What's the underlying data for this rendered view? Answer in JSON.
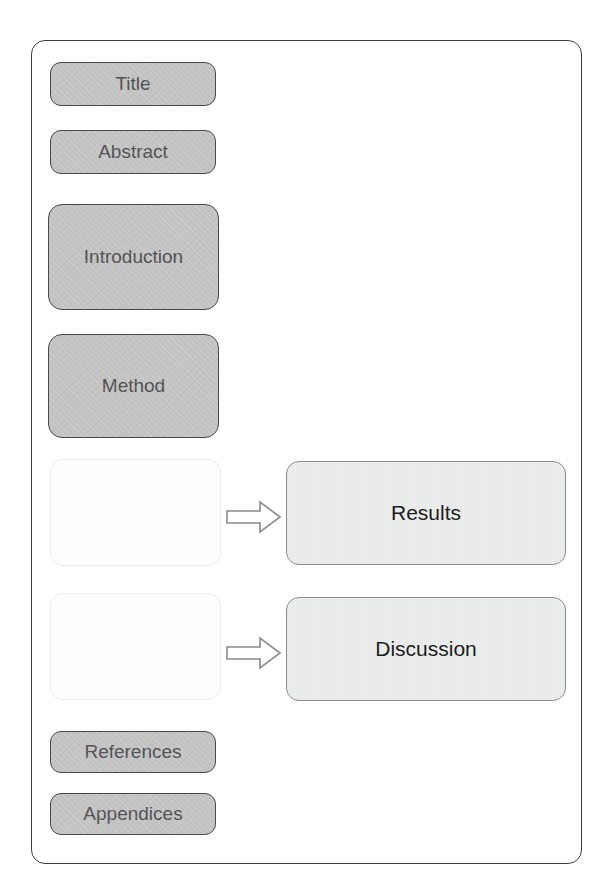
{
  "diagram": {
    "type": "flowchart",
    "title_text": "",
    "frame": {
      "style": "rounded-rectangle-page-border"
    },
    "colors": {
      "section_fill": "#c3c3c3",
      "section_border": "#4a4a4a",
      "section_text": "#4f4f4f",
      "output_fill": "#eceded",
      "output_border": "#8d8d8d",
      "output_text": "#1d1d1d",
      "empty_fill": "#fdfdfd",
      "empty_border": "#ededed",
      "frame_border": "#3f3f3f",
      "arrow_outline": "#8a8a8a",
      "page_background": "#ffffff"
    },
    "nodes": [
      {
        "id": "title",
        "label": "Title",
        "kind": "filled"
      },
      {
        "id": "abstract",
        "label": "Abstract",
        "kind": "filled"
      },
      {
        "id": "introduction",
        "label": "Introduction",
        "kind": "filled"
      },
      {
        "id": "method",
        "label": "Method",
        "kind": "filled"
      },
      {
        "id": "blank-1",
        "label": "",
        "kind": "empty"
      },
      {
        "id": "blank-2",
        "label": "",
        "kind": "empty"
      },
      {
        "id": "references",
        "label": "References",
        "kind": "filled"
      },
      {
        "id": "appendices",
        "label": "Appendices",
        "kind": "filled"
      },
      {
        "id": "results",
        "label": "Results",
        "kind": "output"
      },
      {
        "id": "discussion",
        "label": "Discussion",
        "kind": "output"
      }
    ],
    "arrows": [
      {
        "id": "arrow-to-results",
        "from": "blank-1",
        "to": "results",
        "direction": "right"
      },
      {
        "id": "arrow-to-discussion",
        "from": "blank-2",
        "to": "discussion",
        "direction": "right"
      }
    ]
  }
}
